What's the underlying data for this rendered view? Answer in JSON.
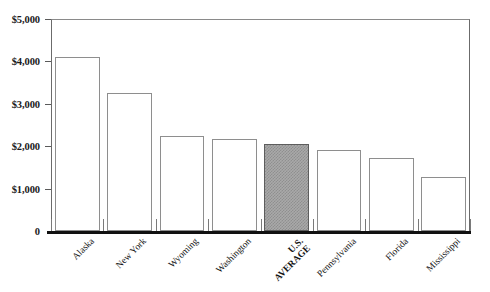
{
  "chart_data": {
    "type": "bar",
    "title": "",
    "subtitle": "",
    "xlabel": "",
    "ylabel": "",
    "categories": [
      "Alaska",
      "New York",
      "Wyoming",
      "Washington",
      "U.S. AVERAGE",
      "Pennsylvania",
      "Florida",
      "Mississippi"
    ],
    "values": [
      4100,
      3250,
      2250,
      2170,
      2050,
      1900,
      1720,
      1280
    ],
    "ylim": [
      0,
      5000
    ],
    "ytick_labels": [
      "$5,000",
      "$4,000",
      "$3,000",
      "$2,000",
      "$1,000",
      "0"
    ],
    "ytick_values": [
      5000,
      4000,
      3000,
      2000,
      1000,
      0
    ],
    "grid": false,
    "legend": "none",
    "highlight_category": "U.S. AVERAGE",
    "highlight_index": 4,
    "bar_fill_color": "#ffffff",
    "bar_border_color": "#8e8e8e",
    "highlight_fill_color": "#a9a9a9",
    "axis_color": "#111111",
    "label_rotation_degrees": -45
  },
  "axis": {
    "y_ticks": [
      {
        "label": "$5,000",
        "value": 5000
      },
      {
        "label": "$4,000",
        "value": 4000
      },
      {
        "label": "$3,000",
        "value": 3000
      },
      {
        "label": "$2,000",
        "value": 2000
      },
      {
        "label": "$1,000",
        "value": 1000
      },
      {
        "label": "0",
        "value": 0
      }
    ],
    "x_ticks": [
      {
        "label": "Alaska",
        "line1": "Alaska",
        "line2": "",
        "bold": false
      },
      {
        "label": "New York",
        "line1": "New York",
        "line2": "",
        "bold": false
      },
      {
        "label": "Wyoming",
        "line1": "Wyoming",
        "line2": "",
        "bold": false
      },
      {
        "label": "Washington",
        "line1": "Washington",
        "line2": "",
        "bold": false
      },
      {
        "label": "U.S. AVERAGE",
        "line1": "U.S.",
        "line2": "AVERAGE",
        "bold": true
      },
      {
        "label": "Pennsylvania",
        "line1": "Pennsylvania",
        "line2": "",
        "bold": false
      },
      {
        "label": "Florida",
        "line1": "Florida",
        "line2": "",
        "bold": false
      },
      {
        "label": "Mississippi",
        "line1": "Mississippi",
        "line2": "",
        "bold": false
      }
    ]
  }
}
